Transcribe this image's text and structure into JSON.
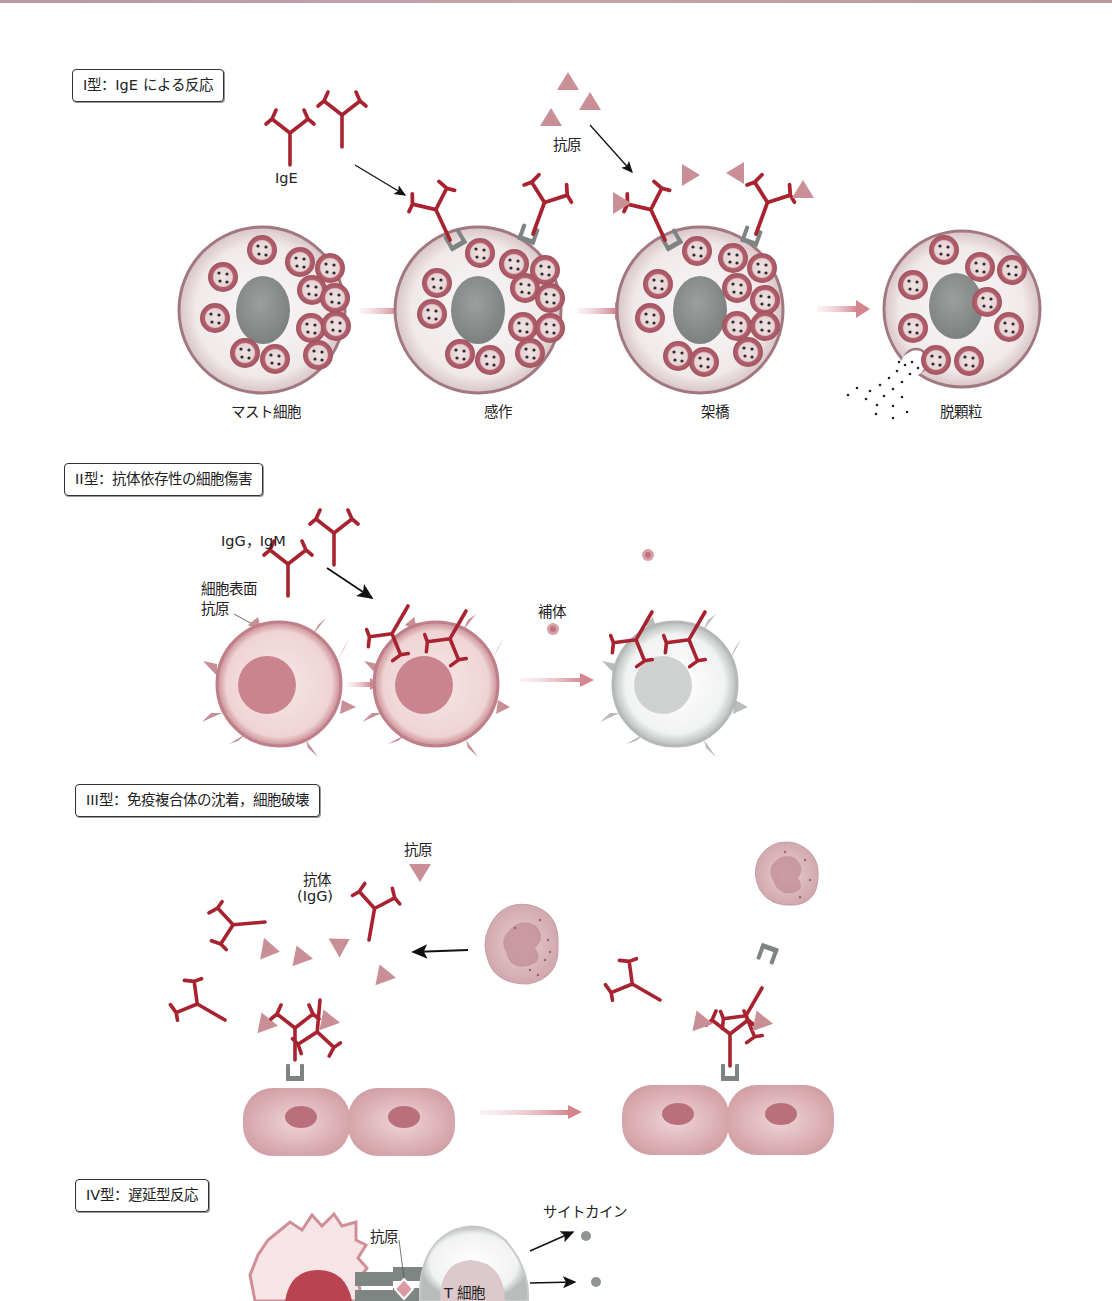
{
  "colors": {
    "antibody": "#a8232f",
    "antigen": "#c88f97",
    "receptor": "#7e8482",
    "cell_membrane": "#b7848c",
    "cell_fill": "#f3eeee",
    "nucleus_gray": "#8d9290",
    "granule": "#b06a75",
    "pink_cell": "#e7c3c6",
    "pink_nucleus": "#c9848d",
    "arrow_pink": "#d89aa0"
  },
  "type1": {
    "title": "I型：IgE による反応",
    "label_ige": "IgE",
    "label_antigen": "抗原",
    "stages": [
      "マスト細胞",
      "感作",
      "架橋",
      "脱顆粒"
    ]
  },
  "type2": {
    "title": "II型：抗体依存性の細胞傷害",
    "label_antibodies": "IgG，IgM",
    "label_surface_antigen_line1": "細胞表面",
    "label_surface_antigen_line2": "抗原",
    "label_complement": "補体"
  },
  "type3": {
    "title": "III型：免疫複合体の沈着，細胞破壊",
    "label_antigen": "抗原",
    "label_antibody_line1": "抗体",
    "label_antibody_line2": "(IgG)"
  },
  "type4": {
    "title": "IV型：遅延型反応",
    "label_antigen": "抗原",
    "label_cytokine": "サイトカイン",
    "label_tcell": "T 細胞"
  }
}
